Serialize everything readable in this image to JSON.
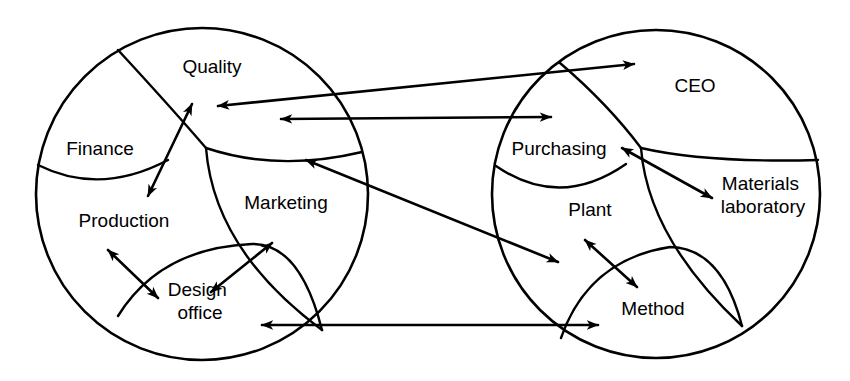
{
  "diagram": {
    "style": {
      "stroke_color": "#000000",
      "background_color": "#ffffff",
      "fill_color": "none",
      "circle_stroke_width": 2.6,
      "divider_stroke_width": 2.4,
      "arrow_stroke_width": 2.6
    },
    "circles": [
      {
        "id": "left-organisation",
        "name": "customer-organisation",
        "cx": 202,
        "cy": 194,
        "r": 166
      },
      {
        "id": "right-organisation",
        "name": "supplier-organisation",
        "cx": 656,
        "cy": 194,
        "r": 164
      }
    ],
    "left_segments": [
      {
        "id": "quality",
        "label": "Quality",
        "x": 212,
        "y": 68
      },
      {
        "id": "finance",
        "label": "Finance",
        "x": 100,
        "y": 150
      },
      {
        "id": "production",
        "label": "Production",
        "x": 124,
        "y": 222
      },
      {
        "id": "marketing",
        "label": "Marketing",
        "x": 286,
        "y": 204
      },
      {
        "id": "design-office",
        "label": "Design office",
        "x": 200,
        "y": 302,
        "lines": [
          "Design",
          "office"
        ]
      }
    ],
    "right_segments": [
      {
        "id": "ceo",
        "label": "CEO",
        "x": 695,
        "y": 87
      },
      {
        "id": "purchasing",
        "label": "Purchasing",
        "x": 559,
        "y": 150
      },
      {
        "id": "plant",
        "label": "Plant",
        "x": 590,
        "y": 211
      },
      {
        "id": "materials-laboratory",
        "label": "Materials laboratory",
        "x": 763,
        "y": 196,
        "lines": [
          "Materials",
          "laboratory"
        ]
      },
      {
        "id": "method",
        "label": "Method",
        "x": 653,
        "y": 310
      }
    ],
    "internal_arrows_left": [
      {
        "id": "quality-production",
        "from": "Quality",
        "to": "Production",
        "heads": "both"
      },
      {
        "id": "production-design-office",
        "from": "Production",
        "to": "Design office",
        "heads": "both"
      },
      {
        "id": "design-office-marketing",
        "from": "Design office",
        "to": "Marketing",
        "heads": "both"
      }
    ],
    "internal_arrows_right": [
      {
        "id": "purchasing-materials-laboratory",
        "from": "Purchasing",
        "to": "Materials laboratory",
        "heads": "both"
      },
      {
        "id": "plant-method",
        "from": "Plant",
        "to": "Method",
        "heads": "both"
      }
    ],
    "cross_arrows": [
      {
        "id": "quality-ceo",
        "from": "Quality",
        "to": "CEO",
        "heads": "both"
      },
      {
        "id": "marketing-purchasing",
        "from": "Marketing",
        "to": "Purchasing",
        "heads": "both"
      },
      {
        "id": "quality-plant",
        "from": "Quality",
        "to": "Plant",
        "heads": "both"
      },
      {
        "id": "design-office-method",
        "from": "Design office",
        "to": "Method",
        "heads": "both"
      }
    ]
  }
}
